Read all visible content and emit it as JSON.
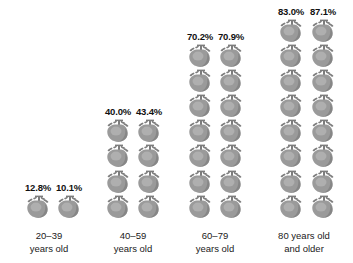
{
  "chart_data": {
    "type": "bar",
    "title": "",
    "subtitle": "",
    "xlabel": "",
    "ylabel": "",
    "grid": false,
    "legend_position": "none",
    "unit": "percent",
    "icon": "heart-icon",
    "icon_value": 10,
    "note": "Pictogram chart: each grey anatomical heart icon represents about 10 percent; two columns per age group.",
    "categories": [
      "20–39 years old",
      "40–59 years old",
      "60–79 years old",
      "80 years old and older"
    ],
    "series": [
      {
        "name": "column-a",
        "values": [
          12.8,
          40.0,
          70.2,
          83.0
        ]
      },
      {
        "name": "column-b",
        "values": [
          10.1,
          43.4,
          70.9,
          87.1
        ]
      }
    ],
    "ylim": [
      0,
      100
    ]
  },
  "chart": {
    "icon_name": "heart-icon",
    "icon_color": "#9a9a9a",
    "icon_color_dark": "#7d7d7d",
    "icon_color_light": "#b5b5b5",
    "label_color": "#111111",
    "background": "#ffffff",
    "groups": [
      {
        "id": "group-20-39",
        "label_line1": "20–39",
        "label_line2": "years old",
        "left": 6,
        "width": 86,
        "columns": [
          {
            "id": "col-20-39-a",
            "value": "12.8%",
            "hearts": 1,
            "left": 15
          },
          {
            "id": "col-20-39-b",
            "value": "10.1%",
            "hearts": 1,
            "left": 46
          }
        ]
      },
      {
        "id": "group-40-59",
        "label_line1": "40–59",
        "label_line2": "years old",
        "left": 90,
        "width": 86,
        "columns": [
          {
            "id": "col-40-59-a",
            "value": "40.0%",
            "hearts": 4,
            "left": 11
          },
          {
            "id": "col-40-59-b",
            "value": "43.4%",
            "hearts": 4,
            "left": 42
          }
        ]
      },
      {
        "id": "group-60-79",
        "label_line1": "60–79",
        "label_line2": "years old",
        "left": 172,
        "width": 86,
        "columns": [
          {
            "id": "col-60-79-a",
            "value": "70.2%",
            "hearts": 7,
            "left": 11
          },
          {
            "id": "col-60-79-b",
            "value": "70.9%",
            "hearts": 7,
            "left": 42
          }
        ]
      },
      {
        "id": "group-80-plus",
        "label_line1": "80 years old",
        "label_line2": "and older",
        "left": 258,
        "width": 92,
        "columns": [
          {
            "id": "col-80-plus-a",
            "value": "83.0%",
            "hearts": 8,
            "left": 16
          },
          {
            "id": "col-80-plus-b",
            "value": "87.1%",
            "hearts": 8,
            "left": 48
          }
        ]
      }
    ]
  }
}
